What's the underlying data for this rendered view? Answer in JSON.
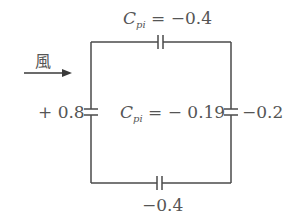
{
  "diagram": {
    "type": "building-pressure-coefficient-circuit",
    "colors": {
      "line": "#4a4a4a",
      "text": "#555555",
      "background": "#ffffff"
    },
    "wind": {
      "label": "風",
      "direction": "right"
    },
    "labels": {
      "top": {
        "symbol": "C",
        "subscript": "pi",
        "equals": " = ",
        "value": "−0.4"
      },
      "center": {
        "symbol": "C",
        "subscript": "pi",
        "equals": " = ",
        "value": "− 0.19"
      },
      "left": {
        "value": "+ 0.8"
      },
      "right": {
        "value": "−0.2"
      },
      "bottom": {
        "value": "−0.4"
      }
    },
    "walls": [
      {
        "side": "windward",
        "coefficient": "+0.8"
      },
      {
        "side": "roof",
        "coefficient": "-0.4"
      },
      {
        "side": "leeward",
        "coefficient": "-0.2"
      },
      {
        "side": "floor",
        "coefficient": "-0.4"
      }
    ],
    "internal_pressure_coefficient": "-0.19"
  }
}
